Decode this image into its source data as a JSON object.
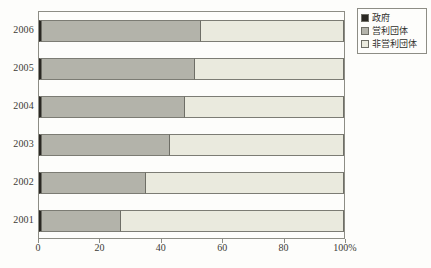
{
  "chart_data": {
    "type": "bar",
    "orientation": "horizontal",
    "stacked": "100%",
    "title": "",
    "xlabel": "",
    "ylabel": "",
    "xlim": [
      0,
      100
    ],
    "grid": false,
    "legend_position": "top-right",
    "categories": [
      "2006",
      "2005",
      "2004",
      "2003",
      "2002",
      "2001"
    ],
    "xtick_labels": [
      "0",
      "20",
      "40",
      "60",
      "80",
      "100%"
    ],
    "xtick_values": [
      0,
      20,
      40,
      60,
      80,
      100
    ],
    "series": [
      {
        "name": "政府",
        "color": "#2a2823",
        "values": [
          1,
          1,
          1,
          1,
          1,
          1
        ]
      },
      {
        "name": "営利団体",
        "color": "#b3b3aa",
        "values": [
          52,
          50,
          47,
          42,
          34,
          26
        ]
      },
      {
        "name": "非営利団体",
        "color": "#eaeade",
        "values": [
          47,
          49,
          52,
          57,
          65,
          73
        ]
      }
    ]
  },
  "legend": {
    "items": [
      {
        "label": "政府",
        "color": "#2a2823"
      },
      {
        "label": "営利団体",
        "color": "#b3b3aa"
      },
      {
        "label": "非営利団体",
        "color": "#eaeade"
      }
    ]
  }
}
